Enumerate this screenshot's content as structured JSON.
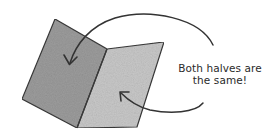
{
  "diagram": {
    "type": "folded-card-illustration",
    "caption": {
      "line1": "Both halves are",
      "line2": "the same!"
    },
    "colors": {
      "left_panel": "#9c9c9c",
      "right_panel": "#c8c8c8",
      "outline": "#3a3a3a",
      "arrow": "#333333",
      "text": "#2a2a2a"
    },
    "shapes": {
      "left_panel": "55,19 107,49 77,128 22,99",
      "right_panel": "107,49 164,42 137,127 77,128"
    },
    "arrows": [
      {
        "name": "upper-arrow",
        "target": "left half"
      },
      {
        "name": "lower-arrow",
        "target": "right half"
      }
    ]
  }
}
